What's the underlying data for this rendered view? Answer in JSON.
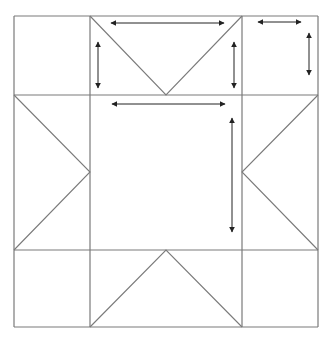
{
  "diagram": {
    "title": "",
    "colors": {
      "background": "#ffffff",
      "grid_line": "#7a7a7a",
      "arrow": "#222222"
    },
    "grid": {
      "x": [
        14,
        90,
        242,
        318
      ],
      "y": [
        16,
        95,
        250,
        327
      ]
    },
    "triangles": [
      {
        "name": "top-flying-geese",
        "points": [
          [
            90,
            16
          ],
          [
            166,
            95
          ],
          [
            242,
            16
          ]
        ]
      },
      {
        "name": "left-flying-geese",
        "points": [
          [
            14,
            95
          ],
          [
            90,
            172
          ],
          [
            14,
            250
          ]
        ]
      },
      {
        "name": "right-flying-geese",
        "points": [
          [
            318,
            95
          ],
          [
            242,
            172
          ],
          [
            318,
            250
          ]
        ]
      },
      {
        "name": "bottom-flying-geese",
        "points": [
          [
            90,
            327
          ],
          [
            166,
            250
          ],
          [
            242,
            327
          ]
        ]
      }
    ],
    "arrows": [
      {
        "name": "top-center-horizontal",
        "x1": 111,
        "y1": 23,
        "x2": 224,
        "y2": 23
      },
      {
        "name": "top-left-vertical",
        "x1": 98,
        "y1": 42,
        "x2": 98,
        "y2": 88
      },
      {
        "name": "top-right-vertical",
        "x1": 234,
        "y1": 42,
        "x2": 234,
        "y2": 88
      },
      {
        "name": "corner-horizontal",
        "x1": 258,
        "y1": 22,
        "x2": 301,
        "y2": 22
      },
      {
        "name": "corner-vertical",
        "x1": 309,
        "y1": 33,
        "x2": 309,
        "y2": 75
      },
      {
        "name": "center-horizontal",
        "x1": 112,
        "y1": 104,
        "x2": 225,
        "y2": 104
      },
      {
        "name": "center-vertical",
        "x1": 232,
        "y1": 118,
        "x2": 232,
        "y2": 232
      }
    ]
  }
}
